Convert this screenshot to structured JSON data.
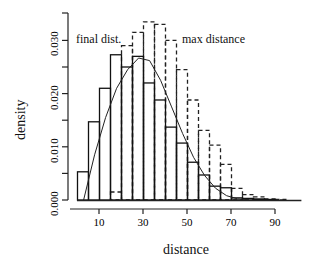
{
  "chart_data": {
    "type": "bar",
    "title": "",
    "xlabel": "distance",
    "ylabel": "density",
    "xlim": [
      0,
      105
    ],
    "ylim": [
      0,
      0.034
    ],
    "grid": false,
    "bin_width": 5,
    "x_ticks": [
      10,
      30,
      50,
      70,
      90
    ],
    "x_tick_labels": [
      "10",
      "30",
      "50",
      "70",
      "90"
    ],
    "y_ticks": [
      0.0,
      0.005,
      0.01,
      0.015,
      0.02,
      0.025,
      0.03
    ],
    "y_tick_labels": [
      "0.000",
      "0.010",
      "0.020",
      "0.030"
    ],
    "annotations": [
      "final dist.",
      "max distance"
    ],
    "series": [
      {
        "name": "final dist.",
        "style": "solid histogram",
        "bin_starts": [
          0,
          5,
          10,
          15,
          20,
          25,
          30,
          35,
          40,
          45,
          50,
          55,
          60,
          65,
          70,
          75,
          80,
          85,
          90
        ],
        "values": [
          0.0053,
          0.0147,
          0.021,
          0.0273,
          0.025,
          0.027,
          0.022,
          0.0188,
          0.0137,
          0.0107,
          0.0071,
          0.0047,
          0.0026,
          0.0023,
          0.0004,
          0.0003,
          0.0002,
          0.0001,
          0.0
        ]
      },
      {
        "name": "max distance",
        "style": "dashed histogram",
        "bin_starts": [
          15,
          20,
          25,
          30,
          35,
          40,
          45,
          50,
          55,
          60,
          65,
          70,
          75,
          80,
          85,
          90
        ],
        "values": [
          0.0015,
          0.029,
          0.0315,
          0.0335,
          0.033,
          0.03,
          0.0245,
          0.0188,
          0.0131,
          0.0103,
          0.0067,
          0.0022,
          0.001,
          0.0006,
          0.0002,
          0.0001
        ]
      },
      {
        "name": "density curve",
        "style": "solid line",
        "x": [
          3,
          8,
          13,
          18,
          23,
          28,
          33,
          38,
          43,
          48,
          53,
          58,
          63,
          68,
          73,
          78
        ],
        "values": [
          0.0,
          0.0085,
          0.0155,
          0.021,
          0.0245,
          0.0267,
          0.0262,
          0.0225,
          0.0175,
          0.0125,
          0.008,
          0.0046,
          0.0022,
          0.0008,
          0.0002,
          0.0001
        ]
      }
    ]
  },
  "labels": {
    "xlabel": "distance",
    "ylabel": "density",
    "annotation_final": "final dist.",
    "annotation_max": "max distance"
  }
}
